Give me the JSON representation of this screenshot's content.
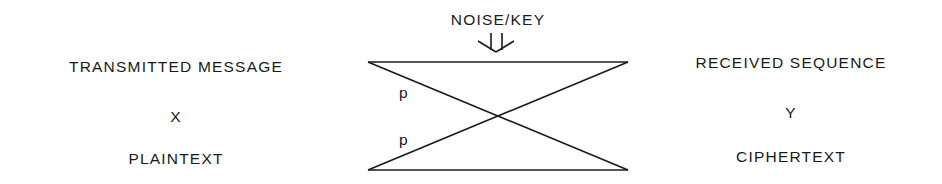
{
  "top": {
    "label": "NOISE/KEY"
  },
  "left": {
    "line1": "TRANSMITTED MESSAGE",
    "line2": "X",
    "line3": "PLAINTEXT"
  },
  "right": {
    "line1": "RECEIVED SEQUENCE",
    "line2": "Y",
    "line3": "CIPHERTEXT"
  },
  "channel": {
    "upper_prob_label": "p",
    "lower_prob_label": "p"
  }
}
